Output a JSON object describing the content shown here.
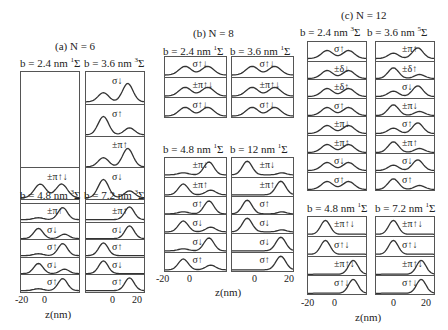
{
  "figure": {
    "groups": [
      {
        "title": "(a)  N = 6",
        "panels": [
          {
            "title": "b = 2.4 nm",
            "state": "1",
            "rows": [
              "",
              "",
              "",
              "±π↑↓",
              "σ↑↓"
            ]
          },
          {
            "title": "b = 3.6 nm",
            "state": "3",
            "rows": [
              "σ↓",
              "σ↑",
              "±π↑",
              "σ↓",
              "σ↑"
            ]
          },
          {
            "title": "b = 4.8 nm",
            "state": "3",
            "rows": [
              "±π↑",
              "σ↓",
              "σ↑",
              "σ↓",
              "σ↑"
            ]
          },
          {
            "title": "b = 7.2 nm",
            "state": "3",
            "rows": [
              "±π↑",
              "σ↓",
              "σ↑",
              "σ↓",
              "σ↑"
            ]
          }
        ],
        "xticks": [
          "-20",
          "0",
          "0",
          "20"
        ],
        "xlabel": "z(nm)"
      },
      {
        "title": "(b)  N = 8",
        "panels": [
          {
            "title": "b = 2.4 nm",
            "state": "1",
            "rows": [
              "σ↑↓",
              "±π↑↓",
              "σ↑↓"
            ]
          },
          {
            "title": "b = 3.6 nm",
            "state": "1",
            "rows": [
              "σ↑↓",
              "±π↑↓",
              "σ↑↓"
            ]
          },
          {
            "title": "b = 4.8 nm",
            "state": "1",
            "rows": [
              "±π↓",
              "±π↑",
              "σ↑",
              "σ↓",
              "σ↓",
              "σ↑"
            ]
          },
          {
            "title": "b = 12  nm",
            "state": "1",
            "rows": [
              "±π↓",
              "±π↑",
              "σ↑",
              "σ↓",
              "σ↓",
              "σ↑"
            ]
          }
        ],
        "xticks": [
          "-20",
          "0",
          "0",
          "20"
        ],
        "xlabel": "z(nm)"
      },
      {
        "title": "(c)  N = 12",
        "panels": [
          {
            "title": "b = 2.4 nm",
            "state": "3",
            "rows": [
              "σ↑",
              "±δ↓",
              "±δ↑",
              "σ↑",
              "±π↓",
              "±π↑",
              "σ↓",
              "σ↑"
            ]
          },
          {
            "title": "b = 3.6 nm",
            "state": "5",
            "rows": [
              "±π↑",
              "±δ↑",
              "σ↓",
              "±π↓",
              "σ↑",
              "±π↑",
              "σ↓",
              "σ↑"
            ]
          },
          {
            "title": "b = 4.8 nm",
            "state": "1",
            "rows": [
              "±π↑↓",
              "σ↑↓",
              "±π↑↓",
              "σ↑↓"
            ]
          },
          {
            "title": "b = 7.2 nm",
            "state": "1",
            "rows": [
              "±π↑↓",
              "σ↑↓",
              "±π↑↓",
              "σ↑↓"
            ]
          }
        ],
        "xticks": [
          "-20",
          "0",
          "0",
          "20"
        ],
        "xlabel": "z(nm)"
      }
    ],
    "sigma_symbol": "Σ"
  }
}
